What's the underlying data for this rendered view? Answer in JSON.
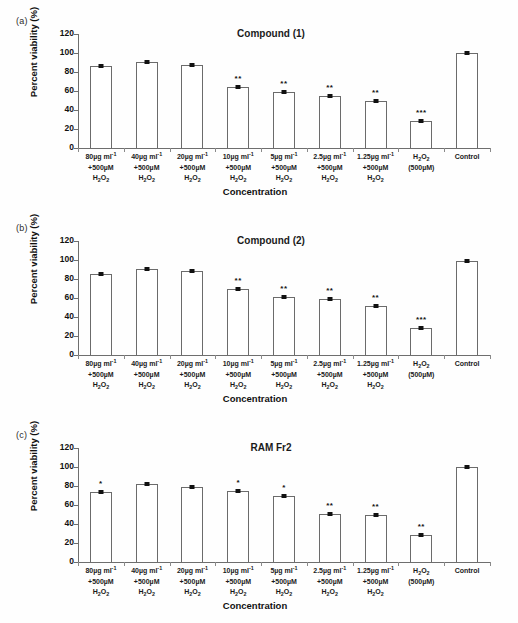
{
  "figure": {
    "ylabel": "Percent viability (%)",
    "xlabel": "Concentration",
    "ytick_labels": [
      "0",
      "20",
      "40",
      "60",
      "80",
      "100",
      "120"
    ],
    "categories_html": [
      "80µg ml<sup>-1</sup>|+500µM|H<sub>2</sub>O<sub>2</sub>",
      "40µg ml<sup>-1</sup>|+500µM|H<sub>2</sub>O<sub>2</sub>",
      "20µg ml<sup>-1</sup>|+500µM|H<sub>2</sub>O<sub>2</sub>",
      "10µg ml<sup>-1</sup>|+500µM|H<sub>2</sub>O<sub>2</sub>",
      "5µg ml<sup>-1</sup>|+500µM|H<sub>2</sub>O<sub>2</sub>",
      "2.5µg ml<sup>-1</sup>|+500µM|H<sub>2</sub>O<sub>2</sub>",
      "1.25µg ml<sup>-1</sup>|+500µM|H<sub>2</sub>O<sub>2</sub>",
      "H<sub>2</sub>O<sub>2</sub>|(500µM)|",
      "Control||"
    ]
  },
  "chart_data": [
    {
      "type": "bar",
      "panel": "(a)",
      "title": "Compound (1)",
      "xlabel": "Concentration",
      "ylabel": "Percent viability (%)",
      "ylim": [
        0,
        120
      ],
      "yticks": [
        0,
        20,
        40,
        60,
        80,
        100,
        120
      ],
      "grid": false,
      "legend": "none",
      "categories": [
        "80µg ml-1 +500µM H2O2",
        "40µg ml-1 +500µM H2O2",
        "20µg ml-1 +500µM H2O2",
        "10µg ml-1 +500µM H2O2",
        "5µg ml-1 +500µM H2O2",
        "2.5µg ml-1 +500µM H2O2",
        "1.25µg ml-1 +500µM H2O2",
        "H2O2 (500µM)",
        "Control"
      ],
      "values": [
        86,
        90.5,
        87,
        64.5,
        58.5,
        54.5,
        49,
        28.5,
        99.5
      ],
      "significance": [
        "",
        "",
        "",
        "**",
        "**",
        "**",
        "**",
        "***",
        ""
      ]
    },
    {
      "type": "bar",
      "panel": "(b)",
      "title": "Compound (2)",
      "xlabel": "Concentration",
      "ylabel": "Percent viability (%)",
      "ylim": [
        0,
        120
      ],
      "yticks": [
        0,
        20,
        40,
        60,
        80,
        100,
        120
      ],
      "grid": false,
      "legend": "none",
      "categories": [
        "80µg ml-1 +500µM H2O2",
        "40µg ml-1 +500µM H2O2",
        "20µg ml-1 +500µM H2O2",
        "10µg ml-1 +500µM H2O2",
        "5µg ml-1 +500µM H2O2",
        "2.5µg ml-1 +500µM H2O2",
        "1.25µg ml-1 +500µM H2O2",
        "H2O2 (500µM)",
        "Control"
      ],
      "values": [
        85,
        90.5,
        88,
        69.5,
        61.5,
        58.5,
        52,
        28.5,
        99
      ],
      "significance": [
        "",
        "",
        "",
        "**",
        "**",
        "**",
        "**",
        "***",
        ""
      ]
    },
    {
      "type": "bar",
      "panel": "(c)",
      "title": "RAM Fr2",
      "xlabel": "Concentration",
      "ylabel": "Percent viability (%)",
      "ylim": [
        0,
        120
      ],
      "yticks": [
        0,
        20,
        40,
        60,
        80,
        100,
        120
      ],
      "grid": false,
      "legend": "none",
      "categories": [
        "80µg ml-1 +500µM H2O2",
        "40µg ml-1 +500µM H2O2",
        "20µg ml-1 +500µM H2O2",
        "10µg ml-1 +500µM H2O2",
        "5µg ml-1 +500µM H2O2",
        "2.5µg ml-1 +500µM H2O2",
        "1.25µg ml-1 +500µM H2O2",
        "H2O2 (500µM)",
        "Control"
      ],
      "values": [
        73.5,
        82,
        79,
        74.5,
        69.5,
        50.5,
        49,
        28.5,
        99.5
      ],
      "significance": [
        "*",
        "",
        "",
        "*",
        "*",
        "**",
        "**",
        "**",
        ""
      ]
    }
  ]
}
